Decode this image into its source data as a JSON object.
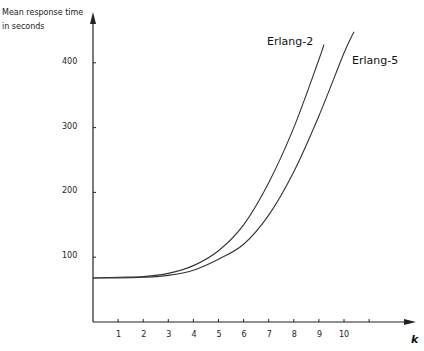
{
  "chart_data": {
    "type": "line",
    "title": "",
    "xlabel": "k",
    "ylabel": "Mean response time in seconds",
    "ylabel_lines": [
      "Mean  response  time",
      "in  seconds"
    ],
    "x_ticks": [
      1,
      2,
      3,
      4,
      5,
      6,
      7,
      8,
      9,
      10
    ],
    "y_ticks": [
      100,
      200,
      300,
      400
    ],
    "xlim": [
      0,
      11.1
    ],
    "ylim": [
      0,
      480
    ],
    "grid": false,
    "legend": "inline labels near curve ends",
    "series": [
      {
        "name": "Erlang-2",
        "x": [
          0,
          1,
          2,
          3,
          4,
          5,
          6,
          7,
          8,
          9,
          9.2
        ],
        "values": [
          68,
          69,
          70,
          75,
          87,
          110,
          150,
          215,
          300,
          405,
          428
        ]
      },
      {
        "name": "Erlang-5",
        "x": [
          0,
          1,
          2,
          3,
          4,
          5,
          6,
          7,
          8,
          9,
          10,
          10.4
        ],
        "values": [
          68,
          68,
          69,
          72,
          80,
          97,
          120,
          165,
          232,
          318,
          415,
          448
        ]
      }
    ]
  }
}
